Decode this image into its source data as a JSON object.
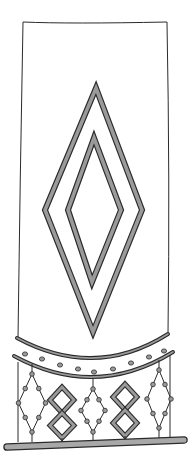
{
  "colors": {
    "background": "#ffffff",
    "stroke": "#2b2b2b",
    "fill": "#9a9a9a",
    "bar": "#a8a8a8"
  },
  "illustration": {
    "subject": "hanging banner with diamond motifs and beaded fringe",
    "panel": {
      "x1": 23,
      "y1": 22,
      "x2": 167,
      "y2": 22,
      "bottom_left": [
        18,
        338
      ],
      "bottom_right": [
        168,
        334
      ]
    },
    "large_diamond": {
      "top": [
        96,
        88
      ],
      "right": [
        142,
        210
      ],
      "bottom": [
        93,
        332
      ],
      "left": [
        45,
        210
      ]
    },
    "small_diamond": {
      "top": [
        94,
        138
      ],
      "right": [
        121,
        210
      ],
      "bottom": [
        92,
        282
      ],
      "left": [
        68,
        210
      ]
    },
    "band_top_curve": "M17 338 Q95 380 168 334",
    "band_bottom_curve": "M14 356 Q95 400 173 352",
    "band_dots": [
      [
        25,
        354
      ],
      [
        42,
        359
      ],
      [
        60,
        365
      ],
      [
        78,
        369
      ],
      [
        94,
        372
      ],
      [
        113,
        369
      ],
      [
        131,
        363
      ],
      [
        149,
        357
      ],
      [
        164,
        351
      ]
    ],
    "fringe_posts": [
      [
        18,
        362,
        18,
        442
      ],
      [
        170,
        355,
        170,
        440
      ]
    ],
    "beaded_diamonds": [
      {
        "cx": 32,
        "top": 374,
        "bottom": 432,
        "w": 27
      },
      {
        "cx": 93,
        "top": 389,
        "bottom": 432,
        "w": 24
      },
      {
        "cx": 159,
        "top": 370,
        "bottom": 428,
        "w": 24
      }
    ],
    "double_diamonds": [
      {
        "cx": 62,
        "top1": 387,
        "mid": 413,
        "bottom": 438,
        "w": 24
      },
      {
        "cx": 125,
        "top1": 384,
        "mid": 410,
        "bottom": 436,
        "w": 24
      }
    ],
    "base_bar": {
      "x1": 7,
      "y1": 447,
      "x2": 184,
      "y2": 440,
      "thickness": 6
    }
  }
}
